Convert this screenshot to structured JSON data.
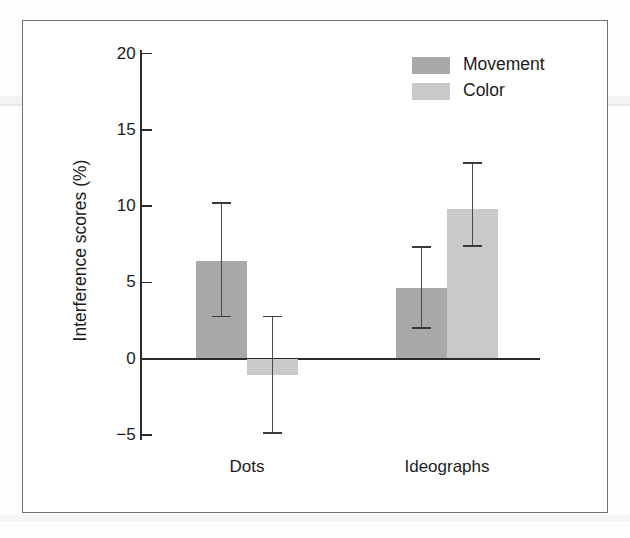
{
  "figure": {
    "background_color": "#ffffff",
    "frame_color": "#6f7174"
  },
  "chart_data": {
    "type": "bar",
    "title": "",
    "subtitle": "",
    "xlabel": "",
    "ylabel": "Interference scores (%)",
    "categories": [
      "Dots",
      "Ideographs"
    ],
    "ylim": [
      -6,
      20
    ],
    "yticks": [
      -5,
      0,
      5,
      10,
      15,
      20
    ],
    "ytick_labels": [
      "−5",
      "0",
      "5",
      "10",
      "15",
      "20"
    ],
    "grid": false,
    "legend_position": "top-right",
    "zero_line": true,
    "series": [
      {
        "name": "Movement",
        "color": "#a9a9a9",
        "values": [
          6.4,
          4.6
        ],
        "error_low": [
          2.75,
          2.0
        ],
        "error_high": [
          10.2,
          7.3
        ]
      },
      {
        "name": "Color",
        "color": "#c9c9c9",
        "values": [
          -1.1,
          9.8
        ],
        "error_low": [
          -4.9,
          7.4
        ],
        "error_high": [
          2.75,
          12.8
        ]
      }
    ],
    "annotations": []
  },
  "axis": {
    "tick_labels": [
      "20",
      "15",
      "10",
      "5",
      "0",
      "−5"
    ],
    "title": "Interference scores (%)"
  },
  "legend": {
    "entries": [
      {
        "label": "Movement",
        "color": "#a9a9a9"
      },
      {
        "label": "Color",
        "color": "#c9c9c9"
      }
    ]
  },
  "x_categories": [
    {
      "label": "Dots"
    },
    {
      "label": "Ideographs"
    }
  ]
}
